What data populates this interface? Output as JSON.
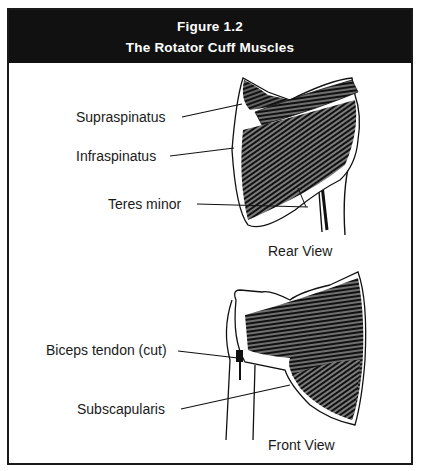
{
  "figure": {
    "number": "Figure 1.2",
    "title": "The Rotator Cuff Muscles"
  },
  "rear_view": {
    "caption": "Rear View",
    "labels": [
      {
        "id": "supraspinatus",
        "text": "Supraspinatus"
      },
      {
        "id": "infraspinatus",
        "text": "Infraspinatus"
      },
      {
        "id": "teres-minor",
        "text": "Teres minor"
      }
    ]
  },
  "front_view": {
    "caption": "Front View",
    "labels": [
      {
        "id": "biceps-tendon",
        "text": "Biceps tendon (cut)"
      },
      {
        "id": "subscapularis",
        "text": "Subscapularis"
      }
    ]
  },
  "colors": {
    "header_bg": "#111111",
    "header_text": "#ffffff",
    "ink": "#1a1a1a",
    "background": "#ffffff"
  }
}
